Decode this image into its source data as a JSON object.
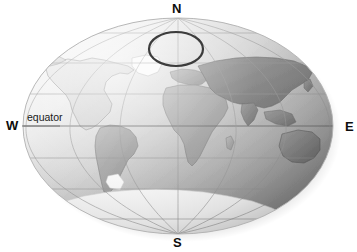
{
  "figure": {
    "kind": "world-map-globe-projection",
    "projection": "elliptical (Mollweide-like) world map",
    "background_color": "#ffffff",
    "shading": "grayscale relief with light-to-dark gradient from upper-left to lower-right"
  },
  "compass": {
    "north_label": "N",
    "south_label": "S",
    "west_label": "W",
    "east_label": "E",
    "color": "#0d0d0d"
  },
  "annotations": {
    "equator_label": "equator",
    "equator_line_color": "#6b6b6b",
    "highlight_ellipse": {
      "name": "arctic-highlight-ellipse",
      "color": "#3c3c3c",
      "cx": 176,
      "cy": 49,
      "rx": 27,
      "ry": 17
    }
  },
  "graticule": {
    "parallel_color": "#9a9a9a",
    "meridian_color": "#9a9a9a",
    "parallels_y": [
      33,
      63,
      94,
      126,
      158,
      189,
      219
    ],
    "meridian_count": 7
  },
  "globe": {
    "center_x": 178,
    "center_y": 126,
    "radius_x": 155,
    "radius_y": 108,
    "ocean_light": "#f2f2f2",
    "ocean_mid": "#cfcfcf",
    "ocean_dark": "#8d8d8d",
    "land_light": "#e2e2e2",
    "land_mid": "#a8a8a8",
    "land_dark": "#7a7a7a",
    "ice_color": "#fbfbfb"
  },
  "landmasses": [
    {
      "name": "north-america",
      "tone": "light"
    },
    {
      "name": "south-america",
      "tone": "mid"
    },
    {
      "name": "greenland",
      "tone": "ice"
    },
    {
      "name": "europe",
      "tone": "mid"
    },
    {
      "name": "africa",
      "tone": "mid"
    },
    {
      "name": "asia",
      "tone": "dark"
    },
    {
      "name": "australia",
      "tone": "dark"
    },
    {
      "name": "antarctica",
      "tone": "ice"
    }
  ]
}
